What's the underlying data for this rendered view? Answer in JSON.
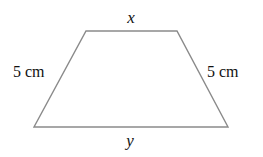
{
  "diagram": {
    "shape": "isosceles-trapezoid",
    "stroke_color": "#8a8a8a",
    "text_color": "#111111",
    "vertices": {
      "top_left": [
        86,
        31
      ],
      "top_right": [
        177,
        31
      ],
      "bottom_right": [
        228,
        127
      ],
      "bottom_left": [
        34,
        127
      ]
    },
    "labels": {
      "top": "x",
      "bottom": "y",
      "left": "5 cm",
      "right": "5 cm"
    }
  }
}
